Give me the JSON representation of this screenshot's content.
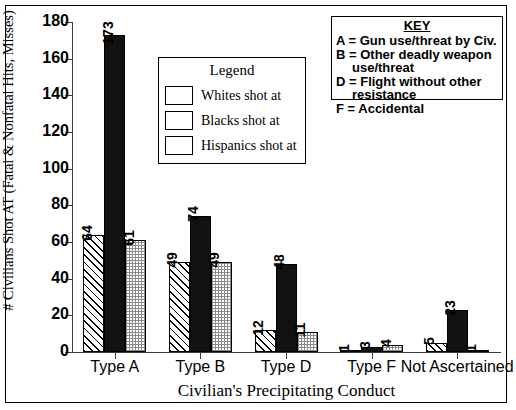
{
  "chart_data": {
    "type": "bar",
    "title": "",
    "xlabel": "Civilian's Precipitating Conduct",
    "ylabel": "# Civilians Shot AT (Fatal & Nonfatal Hits, Misses)",
    "categories": [
      "Type A",
      "Type B",
      "Type D",
      "Type F",
      "Not Ascertained"
    ],
    "series": [
      {
        "name": "Whites shot at",
        "values": [
          64,
          49,
          12,
          1,
          5
        ],
        "pattern": "diagonal-hatch",
        "color": "#ffffff"
      },
      {
        "name": "Blacks shot at",
        "values": [
          173,
          74,
          48,
          3,
          23
        ],
        "pattern": "solid",
        "color": "#111111"
      },
      {
        "name": "Hispanics shot at",
        "values": [
          61,
          49,
          11,
          4,
          1
        ],
        "pattern": "stipple",
        "color": "#d8d8d8"
      }
    ],
    "ylim": [
      0,
      180
    ],
    "yticks": [
      0,
      20,
      40,
      60,
      80,
      100,
      120,
      140,
      160,
      180
    ],
    "ytick_labels": [
      "0",
      "20",
      "40",
      "60",
      "80",
      "100",
      "120",
      "140",
      "160",
      "180"
    ],
    "grid": false,
    "legend_position": "inside-upper-center",
    "data_labels_rotated": true
  },
  "legend": {
    "title": "Legend",
    "entries": [
      {
        "label": "Whites shot at"
      },
      {
        "label": "Blacks shot at"
      },
      {
        "label": "Hispanics shot at"
      }
    ]
  },
  "key": {
    "title": "KEY",
    "lines": [
      {
        "text": "A = Gun use/threat by Civ.",
        "continuation": ""
      },
      {
        "text": "B = Other deadly weapon",
        "continuation": "use/threat"
      },
      {
        "text": "D = Flight without other",
        "continuation": "resistance"
      },
      {
        "text": "F = Accidental",
        "continuation": ""
      }
    ]
  }
}
